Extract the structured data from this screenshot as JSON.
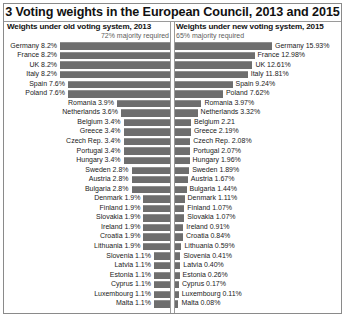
{
  "chart_data": {
    "type": "bar",
    "title": "3 Voting weights in the European Council, 2013 and 2015",
    "layout": "diverging paired bar chart, two panels sharing country rows",
    "grid": false,
    "legend": "none",
    "panels": [
      {
        "header": "Weights under old voting system, 2013",
        "subtitle": "72% majority required",
        "xlabel": "",
        "ylabel": "",
        "direction": "right-to-left (bars grow leftward from centre divider)",
        "unit": "%",
        "max_value": 8.2
      },
      {
        "header": "Weights under new voting system, 2015",
        "subtitle": "65% majority required",
        "xlabel": "",
        "ylabel": "",
        "direction": "left-to-right (bars grow rightward from centre divider)",
        "unit": "%",
        "max_value": 15.93
      }
    ],
    "categories": [
      "Germany",
      "France",
      "UK",
      "Italy",
      "Spain",
      "Poland",
      "Romania",
      "Netherlands",
      "Belgium",
      "Greece",
      "Czech Rep.",
      "Portugal",
      "Hungary",
      "Sweden",
      "Austria",
      "Bulgaria",
      "Denmark",
      "Finland",
      "Slovakia",
      "Ireland",
      "Croatia",
      "Lithuania",
      "Slovenia",
      "Latvia",
      "Estonia",
      "Cyprus",
      "Luxembourg",
      "Malta"
    ],
    "series": [
      {
        "name": "Weights under old voting system, 2013",
        "values": [
          8.2,
          8.2,
          8.2,
          8.2,
          7.6,
          7.6,
          3.9,
          3.6,
          3.4,
          3.4,
          3.4,
          3.4,
          3.4,
          2.8,
          2.8,
          2.8,
          1.9,
          1.9,
          1.9,
          1.9,
          1.9,
          1.9,
          1.1,
          1.1,
          1.1,
          1.1,
          1.1,
          1.1
        ]
      },
      {
        "name": "Weights under new voting system, 2015",
        "values": [
          15.93,
          12.98,
          12.61,
          11.81,
          9.24,
          7.62,
          3.97,
          3.32,
          2.21,
          2.19,
          2.08,
          2.07,
          1.96,
          1.89,
          1.67,
          1.44,
          1.11,
          1.07,
          1.07,
          0.91,
          0.84,
          0.59,
          0.41,
          0.4,
          0.26,
          0.17,
          0.11,
          0.08
        ]
      }
    ]
  },
  "rows": [
    {
      "label_left": "Germany 8.2%",
      "label_right": "Germany 15.93%",
      "v_left": 8.2,
      "v_right": 15.93
    },
    {
      "label_left": "France 8.2%",
      "label_right": "France 12.98%",
      "v_left": 8.2,
      "v_right": 12.98
    },
    {
      "label_left": "UK 8.2%",
      "label_right": "UK 12.61%",
      "v_left": 8.2,
      "v_right": 12.61
    },
    {
      "label_left": "Italy 8.2%",
      "label_right": "Italy 11.81%",
      "v_left": 8.2,
      "v_right": 11.81
    },
    {
      "label_left": "Spain 7.6%",
      "label_right": "Spain 9.24%",
      "v_left": 7.6,
      "v_right": 9.24
    },
    {
      "label_left": "Poland 7.6%",
      "label_right": "Poland 7.62%",
      "v_left": 7.6,
      "v_right": 7.62
    },
    {
      "label_left": "Romania 3.9%",
      "label_right": "Romania 3.97%",
      "v_left": 3.9,
      "v_right": 3.97
    },
    {
      "label_left": "Netherlands 3.6%",
      "label_right": "Netherlands 3.32%",
      "v_left": 3.6,
      "v_right": 3.32
    },
    {
      "label_left": "Belgium 3.4%",
      "label_right": "Belgium 2.21",
      "v_left": 3.4,
      "v_right": 2.21
    },
    {
      "label_left": "Greece 3.4%",
      "label_right": "Greece 2.19%",
      "v_left": 3.4,
      "v_right": 2.19
    },
    {
      "label_left": "Czech Rep. 3.4%",
      "label_right": "Czech Rep. 2.08%",
      "v_left": 3.4,
      "v_right": 2.08
    },
    {
      "label_left": "Portugal 3.4%",
      "label_right": "Portugal 2.07%",
      "v_left": 3.4,
      "v_right": 2.07
    },
    {
      "label_left": "Hungary 3.4%",
      "label_right": "Hungary 1.96%",
      "v_left": 3.4,
      "v_right": 1.96
    },
    {
      "label_left": "Sweden 2.8%",
      "label_right": "Sweden 1.89%",
      "v_left": 2.8,
      "v_right": 1.89
    },
    {
      "label_left": "Austria 2.8%",
      "label_right": "Austria 1.67%",
      "v_left": 2.8,
      "v_right": 1.67
    },
    {
      "label_left": "Bulgaria 2.8%",
      "label_right": "Bulgaria 1.44%",
      "v_left": 2.8,
      "v_right": 1.44
    },
    {
      "label_left": "Denmark 1.9%",
      "label_right": "Denmark 1.11%",
      "v_left": 1.9,
      "v_right": 1.11
    },
    {
      "label_left": "Finland 1.9%",
      "label_right": "Finland 1.07%",
      "v_left": 1.9,
      "v_right": 1.07
    },
    {
      "label_left": "Slovakia 1.9%",
      "label_right": "Slovakia 1.07%",
      "v_left": 1.9,
      "v_right": 1.07
    },
    {
      "label_left": "Ireland 1.9%",
      "label_right": "Ireland 0.91%",
      "v_left": 1.9,
      "v_right": 0.91
    },
    {
      "label_left": "Croatia 1.9%",
      "label_right": "Croatia 0.84%",
      "v_left": 1.9,
      "v_right": 0.84
    },
    {
      "label_left": "Lithuania 1.9%",
      "label_right": "Lithuania 0.59%",
      "v_left": 1.9,
      "v_right": 0.59
    },
    {
      "label_left": "Slovenia 1.1%",
      "label_right": "Slovenia 0.41%",
      "v_left": 1.1,
      "v_right": 0.41
    },
    {
      "label_left": "Latvia 1.1%",
      "label_right": "Latvia 0.40%",
      "v_left": 1.1,
      "v_right": 0.4
    },
    {
      "label_left": "Estonia 1.1%",
      "label_right": "Estonia 0.26%",
      "v_left": 1.1,
      "v_right": 0.26
    },
    {
      "label_left": "Cyprus 1.1%",
      "label_right": "Cyprus 0.17%",
      "v_left": 1.1,
      "v_right": 0.17
    },
    {
      "label_left": "Luxembourg 1.1%",
      "label_right": "Luxembourg 0.11%",
      "v_left": 1.1,
      "v_right": 0.11
    },
    {
      "label_left": "Malta 1.1%",
      "label_right": "Malta 0.08%",
      "v_left": 1.1,
      "v_right": 0.08
    }
  ],
  "style": {
    "bar_color": "#6e6e6e",
    "bar_top_color": "#8f8f8f",
    "rule_color": "#9a9a9a",
    "text_color": "#1a1a1a",
    "subtitle_color": "#5d5d5d",
    "background": "#ffffff"
  },
  "geometry": {
    "left_bar_max_px": 110,
    "right_bar_max_px": 97,
    "left_scale_max": 8.2,
    "right_scale_max": 15.93,
    "left_bar_min_px": 16,
    "right_bar_min_px": 3
  }
}
